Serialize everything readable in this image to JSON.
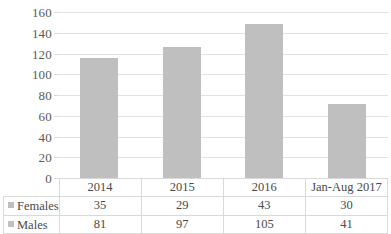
{
  "chart_data": {
    "type": "bar",
    "title": "",
    "subtitle": "",
    "xlabel": "",
    "ylabel": "",
    "categories": [
      "2014",
      "2015",
      "2016",
      "Jan-Aug 2017"
    ],
    "series": [
      {
        "name": "Females",
        "values": [
          35,
          29,
          43,
          30
        ]
      },
      {
        "name": "Males",
        "values": [
          81,
          97,
          105,
          41
        ]
      }
    ],
    "totals": [
      116,
      126,
      148,
      71
    ],
    "ylim": [
      0,
      160
    ],
    "ytick_values": [
      160,
      140,
      120,
      100,
      80,
      60,
      40,
      20,
      0
    ],
    "ytick_labels": [
      "160",
      "140",
      "120",
      "100",
      "80",
      "60",
      "40",
      "20",
      "0"
    ],
    "grid": true,
    "legend_position": "table-left",
    "bar_color": "#bfbfbf",
    "gridline_color": "#e2e2e2",
    "table_border_color": "#d9d9d9",
    "text_color": "#4a4a4a"
  },
  "data_table": {
    "header_row": [
      "",
      "2014",
      "2015",
      "2016",
      "Jan-Aug 2017"
    ],
    "rows": [
      {
        "label": "Females",
        "values": [
          "35",
          "29",
          "43",
          "30"
        ]
      },
      {
        "label": "Males",
        "values": [
          "81",
          "97",
          "105",
          "41"
        ]
      }
    ]
  }
}
